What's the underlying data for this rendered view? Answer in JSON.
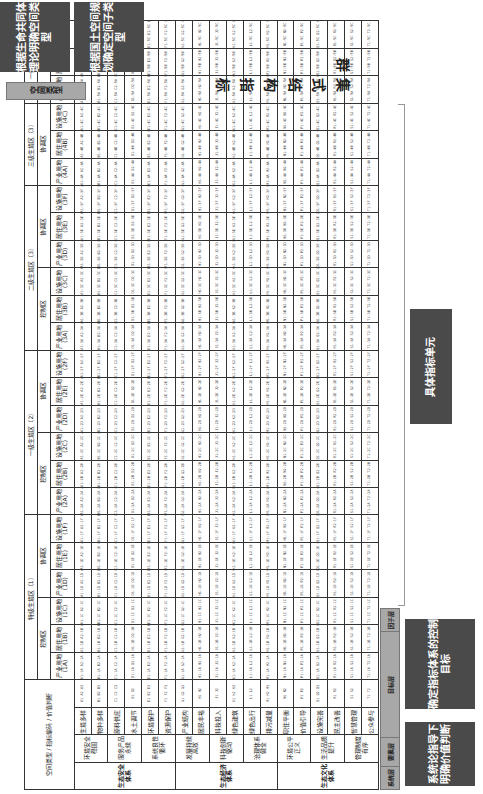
{
  "title": "集式结构指标群",
  "left_notes": {
    "top": "根据生命共同体理论明确空间类型",
    "bottom": "根据国土空间规划确定空间子类型",
    "space_type_label": "空间类型"
  },
  "right_notes": {
    "unit": "具体指标单元",
    "target": "确定指标体系的控制目标",
    "system": "系统论指导下明确价值判断"
  },
  "layer_labels": {
    "factor": "因子层",
    "target": "目标层",
    "element": "要素层",
    "system": "系统层"
  },
  "corner": {
    "space_type": "空间类型",
    "indicator_code": "指标编码",
    "value_judgment": "价值判断"
  },
  "zones": [
    {
      "name": "特级生境区（1）",
      "subs": [
        {
          "name": "控制区",
          "cols": [
            "产业用地(1A)",
            "居住用地(1B)",
            "设施用地(1C)"
          ]
        },
        {
          "name": "协调区",
          "cols": [
            "产业用地(1D)",
            "居住用地(1E)",
            "设施用地(1F)"
          ]
        }
      ]
    },
    {
      "name": "一级生境区（2）",
      "subs": [
        {
          "name": "控制区",
          "cols": [
            "产业用地(2A)",
            "居住用地(2B)",
            "设施用地(2C)"
          ]
        },
        {
          "name": "协调区",
          "cols": [
            "产业用地(2D)",
            "居住用地(2E)",
            "设施用地(2F)"
          ]
        }
      ]
    },
    {
      "name": "二级生境区（3）",
      "subs": [
        {
          "name": "控制区",
          "cols": [
            "产业用地(3A)",
            "居住用地(3B)",
            "设施用地(3C)"
          ]
        },
        {
          "name": "协调区",
          "cols": [
            "产业用地(3D)",
            "居住用地(3E)",
            "设施用地(3F)"
          ]
        }
      ]
    },
    {
      "name": "三级生境区（3）",
      "subs": [
        {
          "name": "协调区",
          "cols": [
            "产业用地(4A)",
            "居住用地(4B)",
            "设施用地(4C)"
          ]
        }
      ]
    },
    {
      "name": "一般区（5）",
      "subs": [
        {
          "name": "",
          "cols": [
            "产业用地(5A)",
            "居住用地(5B)",
            "设施用地(5C)"
          ]
        }
      ]
    }
  ],
  "systems": [
    {
      "name": "生态安全体系",
      "elements": [
        {
          "name": "环境安全稳固",
          "targets": [
            "生境多样 (A)",
            "物种多样 (B)"
          ]
        },
        {
          "name": "服务产品永续",
          "targets": [
            "原料供应 (C)",
            "水土调节 (D)"
          ]
        },
        {
          "name": "系统良性循环",
          "targets": [
            "环境保护 (E)",
            "资源保护 (F)"
          ]
        }
      ]
    },
    {
      "name": "生态经济体系",
      "elements": [
        {
          "name": "发展持续高效",
          "targets": [
            "产业结构 (G)",
            "居民丰裕 (H)"
          ]
        },
        {
          "name": "科技创新驱动",
          "targets": [
            "科技投入 (J)",
            "绿色建筑 (K)"
          ]
        },
        {
          "name": "治理体系健全",
          "targets": [
            "绿色出行 (L)",
            "排污减量 (M)"
          ]
        }
      ]
    },
    {
      "name": "生态文化体系",
      "elements": [
        {
          "name": "环境公平正义",
          "targets": [
            "职住平衡 (N)",
            "价值引导 (P)"
          ]
        },
        {
          "name": "生活品质提升",
          "targets": [
            "设施完善 (Q)",
            "民主改善 (R)"
          ]
        },
        {
          "name": "管理制度有序",
          "targets": [
            "智慧管理 (S)",
            "公众参与 (T)"
          ]
        }
      ]
    }
  ],
  "factor_codes": [
    "A1",
    "A2",
    "A3",
    "B1",
    "B2",
    "B3",
    "C1",
    "C2",
    "C3",
    "D1",
    "D2",
    "E1",
    "E2",
    "E3",
    "F1",
    "F2",
    "F3",
    "G1",
    "G2",
    "G3",
    "H1",
    "H2",
    "J1",
    "J2",
    "K1",
    "K2",
    "K3",
    "L1",
    "L2",
    "M1",
    "M2",
    "M3",
    "N1",
    "N2",
    "P1",
    "P2",
    "Q1",
    "Q2",
    "Q3",
    "R1",
    "R2",
    "S1",
    "S2",
    "T1",
    "T2"
  ]
}
